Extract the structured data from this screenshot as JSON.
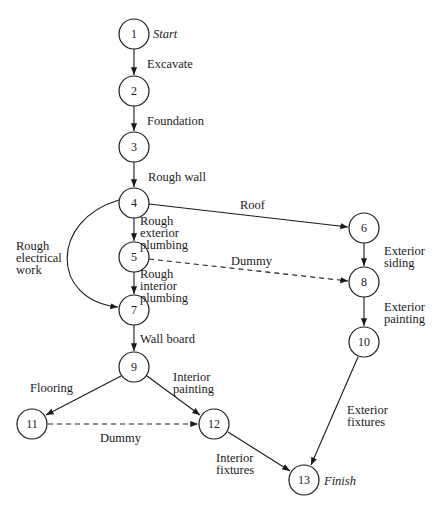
{
  "diagram": {
    "type": "activity-on-arrow network",
    "nodes": [
      {
        "id": "1",
        "x": 134,
        "y": 34,
        "note": "Start"
      },
      {
        "id": "2",
        "x": 134,
        "y": 91
      },
      {
        "id": "3",
        "x": 134,
        "y": 147
      },
      {
        "id": "4",
        "x": 134,
        "y": 203
      },
      {
        "id": "5",
        "x": 134,
        "y": 257
      },
      {
        "id": "6",
        "x": 364,
        "y": 228
      },
      {
        "id": "7",
        "x": 134,
        "y": 310
      },
      {
        "id": "8",
        "x": 364,
        "y": 282
      },
      {
        "id": "9",
        "x": 134,
        "y": 367
      },
      {
        "id": "10",
        "x": 364,
        "y": 342
      },
      {
        "id": "11",
        "x": 32,
        "y": 424
      },
      {
        "id": "12",
        "x": 214,
        "y": 424
      },
      {
        "id": "13",
        "x": 304,
        "y": 480,
        "note": "Finish"
      }
    ],
    "edges": [
      {
        "from": "1",
        "to": "2",
        "label": [
          "Excavate"
        ],
        "style": "solid"
      },
      {
        "from": "2",
        "to": "3",
        "label": [
          "Foundation"
        ],
        "style": "solid"
      },
      {
        "from": "3",
        "to": "4",
        "label": [
          "Rough wall"
        ],
        "style": "solid"
      },
      {
        "from": "4",
        "to": "6",
        "label": [
          "Roof"
        ],
        "style": "solid"
      },
      {
        "from": "4",
        "to": "5",
        "label": [
          "Rough",
          "exterior",
          "plumbing"
        ],
        "style": "solid"
      },
      {
        "from": "4",
        "to": "7",
        "label": [
          "Rough",
          "electrical",
          "work"
        ],
        "style": "solid",
        "curved": true
      },
      {
        "from": "5",
        "to": "8",
        "label": [
          "Dummy"
        ],
        "style": "dashed"
      },
      {
        "from": "5",
        "to": "7",
        "label": [
          "Rough",
          "interior",
          "plumbing"
        ],
        "style": "solid"
      },
      {
        "from": "6",
        "to": "8",
        "label": [
          "Exterior",
          "siding"
        ],
        "style": "solid"
      },
      {
        "from": "8",
        "to": "10",
        "label": [
          "Exterior",
          "painting"
        ],
        "style": "solid"
      },
      {
        "from": "7",
        "to": "9",
        "label": [
          "Wall board"
        ],
        "style": "solid"
      },
      {
        "from": "9",
        "to": "11",
        "label": [
          "Flooring"
        ],
        "style": "solid"
      },
      {
        "from": "9",
        "to": "12",
        "label": [
          "Interior",
          "painting"
        ],
        "style": "solid"
      },
      {
        "from": "11",
        "to": "12",
        "label": [
          "Dummy"
        ],
        "style": "dashed"
      },
      {
        "from": "12",
        "to": "13",
        "label": [
          "Interior",
          "fixtures"
        ],
        "style": "solid"
      },
      {
        "from": "10",
        "to": "13",
        "label": [
          "Exterior",
          "fixtures"
        ],
        "style": "solid"
      }
    ]
  },
  "labels": {
    "start": "Start",
    "finish": "Finish",
    "excavate": "Excavate",
    "foundation": "Foundation",
    "rough_wall": "Rough wall",
    "roof": "Roof",
    "rough_ext_plumb": [
      "Rough",
      "exterior",
      "plumbing"
    ],
    "rough_elec": [
      "Rough",
      "electrical",
      "work"
    ],
    "dummy_5_8": "Dummy",
    "rough_int_plumb": [
      "Rough",
      "interior",
      "plumbing"
    ],
    "ext_siding": [
      "Exterior",
      "siding"
    ],
    "ext_painting": [
      "Exterior",
      "painting"
    ],
    "wall_board": "Wall board",
    "flooring": "Flooring",
    "int_painting": [
      "Interior",
      "painting"
    ],
    "dummy_11_12": "Dummy",
    "int_fixtures": [
      "Interior",
      "fixtures"
    ],
    "ext_fixtures": [
      "Exterior",
      "fixtures"
    ]
  },
  "node_numbers": {
    "n1": "1",
    "n2": "2",
    "n3": "3",
    "n4": "4",
    "n5": "5",
    "n6": "6",
    "n7": "7",
    "n8": "8",
    "n9": "9",
    "n10": "10",
    "n11": "11",
    "n12": "12",
    "n13": "13"
  }
}
